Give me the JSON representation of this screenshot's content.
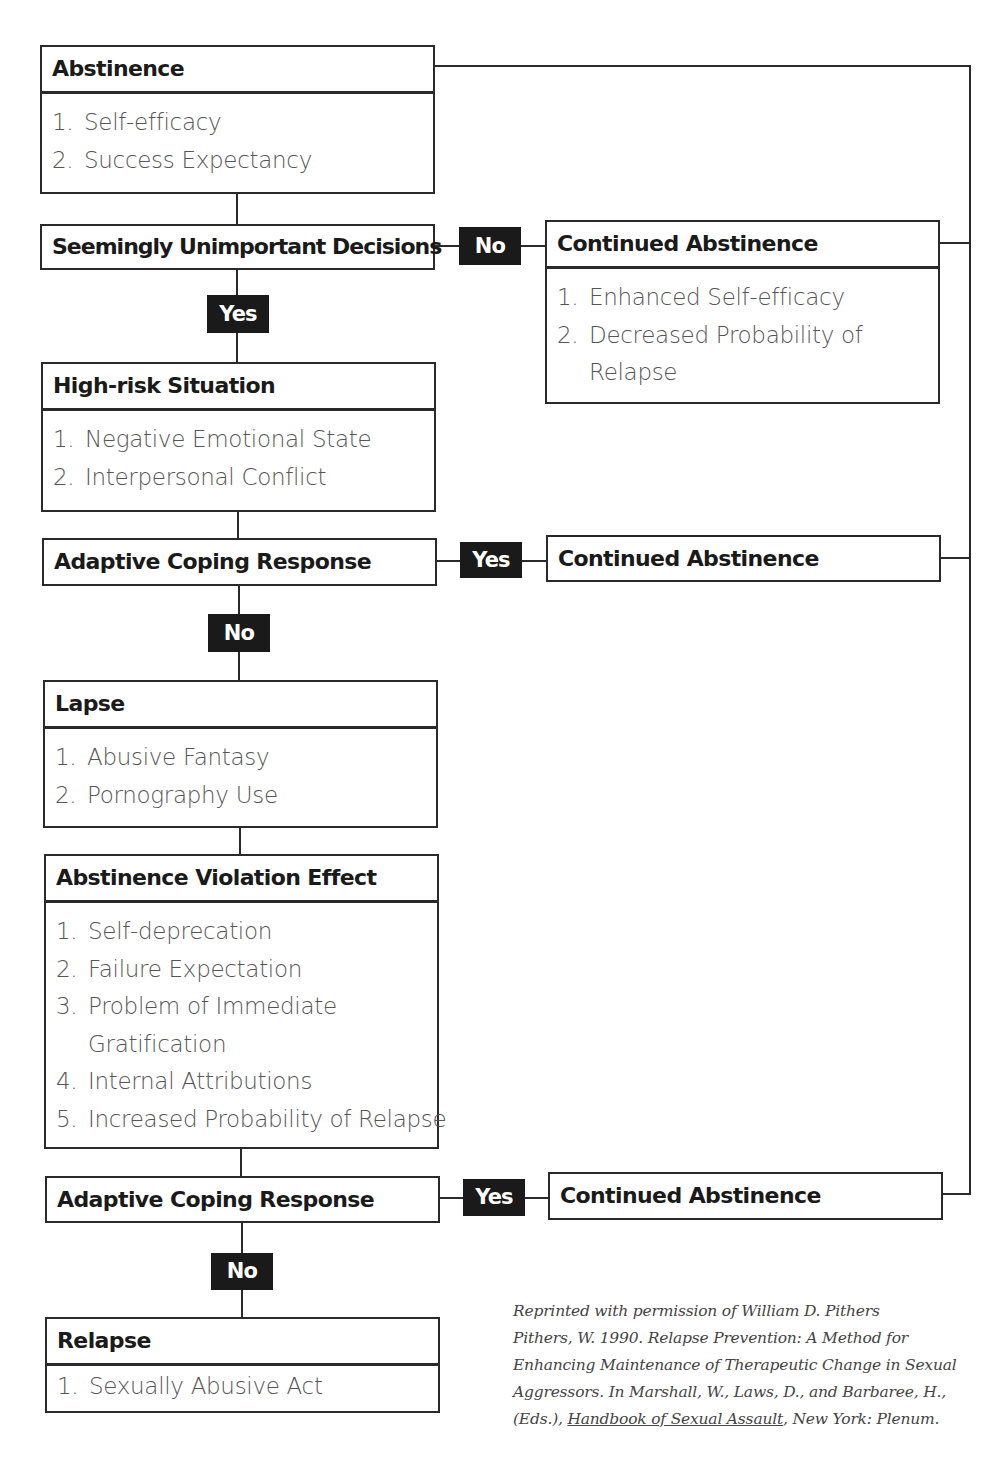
{
  "diagram": {
    "abstinence": {
      "title": "Abstinence",
      "items": [
        {
          "num": "1.",
          "text": "Self-efficacy"
        },
        {
          "num": "2.",
          "text": "Success Expectancy"
        }
      ]
    },
    "sud": {
      "title": "Seemingly Unimportant Decisions",
      "no_label": "No",
      "yes_label": "Yes"
    },
    "continued_abstinence_1": {
      "title": "Continued Abstinence",
      "items": [
        {
          "num": "1.",
          "text": "Enhanced Self-efficacy"
        },
        {
          "num": "2.",
          "text": "Decreased Probability of",
          "cont": "Relapse"
        }
      ]
    },
    "high_risk": {
      "title": "High-risk Situation",
      "items": [
        {
          "num": "1.",
          "text": "Negative Emotional State"
        },
        {
          "num": "2.",
          "text": "Interpersonal Conflict"
        }
      ]
    },
    "coping_1": {
      "title": "Adaptive Coping Response",
      "yes_label": "Yes",
      "no_label": "No"
    },
    "continued_abstinence_2": {
      "title": "Continued Abstinence"
    },
    "lapse": {
      "title": "Lapse",
      "items": [
        {
          "num": "1.",
          "text": "Abusive Fantasy"
        },
        {
          "num": "2.",
          "text": "Pornography Use"
        }
      ]
    },
    "ave": {
      "title": "Abstinence Violation Effect",
      "items": [
        {
          "num": "1.",
          "text": "Self-deprecation"
        },
        {
          "num": "2.",
          "text": "Failure Expectation"
        },
        {
          "num": "3.",
          "text": "Problem of Immediate",
          "cont": "Gratification"
        },
        {
          "num": "4.",
          "text": "Internal Attributions"
        },
        {
          "num": "5.",
          "text": "Increased Probability of Relapse"
        }
      ]
    },
    "coping_2": {
      "title": "Adaptive Coping Response",
      "yes_label": "Yes",
      "no_label": "No"
    },
    "continued_abstinence_3": {
      "title": "Continued Abstinence"
    },
    "relapse": {
      "title": "Relapse",
      "items": [
        {
          "num": "1.",
          "text": "Sexually Abusive Act"
        }
      ]
    }
  },
  "citation": {
    "line1": "Reprinted with permission of William D. Pithers",
    "line2": "Pithers, W. 1990. Relapse Prevention: A Method for",
    "line3": "Enhancing Maintenance of Therapeutic Change in Sexual",
    "line4": "Aggressors. In Marshall, W., Laws, D., and Barbaree, H.,",
    "line5_pre": "(Eds.), ",
    "line5_title": "Handbook of Sexual Assault",
    "line5_post": ", New York: Plenum."
  },
  "colors": {
    "line": "#2a2a2a",
    "tag_bg": "#1a1a1a",
    "tag_text": "#ffffff",
    "body_text": "#555555"
  }
}
